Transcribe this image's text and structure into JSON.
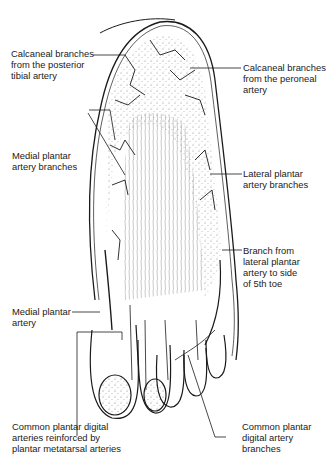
{
  "figure": {
    "labels": {
      "calcaneal_posterior_tibial": [
        "Calcaneal branches",
        "from the posterior",
        "tibial artery"
      ],
      "calcaneal_peroneal": [
        "Calcaneal branches",
        "from the peroneal",
        "artery"
      ],
      "medial_plantar_branches": [
        "Medial plantar",
        "artery branches"
      ],
      "lateral_plantar_branches": [
        "Lateral plantar",
        "artery branches"
      ],
      "branch_5th_toe": [
        "Branch from",
        "lateral plantar",
        "artery to side",
        "of 5th toe"
      ],
      "medial_plantar_artery": [
        "Medial plantar",
        "artery"
      ],
      "common_plantar_digital_reinforced": [
        "Common plantar digital",
        "arteries reinforced by",
        "plantar metatarsal arteries"
      ],
      "common_plantar_digital_branches": [
        "Common plantar",
        "digital artery",
        "branches"
      ]
    },
    "colors": {
      "ink": "#1a1a1a",
      "background": "#ffffff",
      "stipple": "#555555"
    }
  }
}
